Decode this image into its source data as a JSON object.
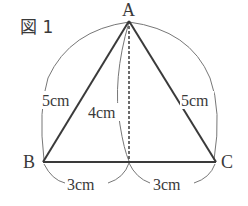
{
  "figure": {
    "title": "図 1",
    "vertices": {
      "A": {
        "label": "A",
        "x": 129,
        "y": 21
      },
      "B": {
        "label": "B",
        "x": 43,
        "y": 162
      },
      "C": {
        "label": "C",
        "x": 216,
        "y": 162
      },
      "H": {
        "x": 129,
        "y": 162
      }
    },
    "measurements": {
      "AB": "5cm",
      "AC": "5cm",
      "height": "4cm",
      "BH": "3cm",
      "HC": "3cm"
    },
    "colors": {
      "line": "#3a3a3a",
      "arc": "#777777"
    }
  }
}
